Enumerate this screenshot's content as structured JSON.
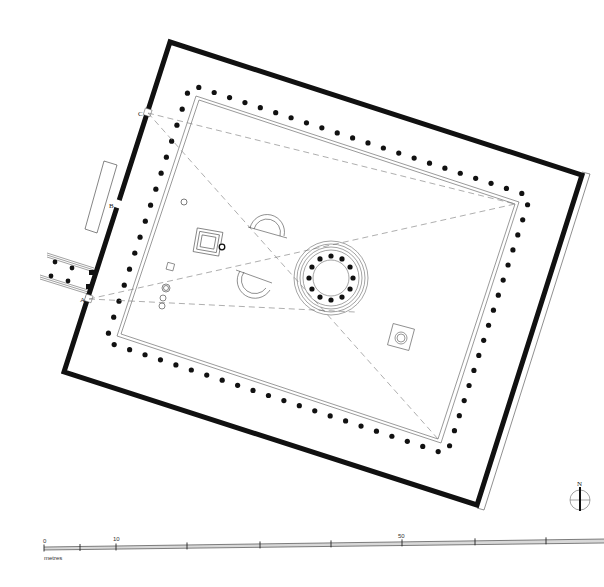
{
  "plan": {
    "title": "Site plan of a colonnaded sanctuary with central tholos",
    "outer_wall": {
      "corners": [
        [
          170,
          42
        ],
        [
          582,
          175
        ],
        [
          477,
          505
        ],
        [
          64,
          372
        ]
      ],
      "color": "#111111"
    },
    "colonnade_stylobate": {
      "corners": [
        [
          196,
          96
        ],
        [
          519,
          202
        ],
        [
          441,
          443
        ],
        [
          117,
          336
        ]
      ]
    },
    "survey_points": [
      {
        "label": "A",
        "x": 89,
        "y": 299
      },
      {
        "label": "B",
        "x": 118,
        "y": 205
      },
      {
        "label": "C",
        "x": 148,
        "y": 113
      }
    ],
    "sight_lines_color": "#777777",
    "tholos": {
      "cx": 331,
      "cy": 278,
      "column_count": 12
    },
    "north_arrow": {
      "label": "N",
      "cx": 580,
      "cy": 500
    }
  },
  "scale_bar": {
    "unit": "metres",
    "labels": [
      {
        "text": "0",
        "x": 44
      },
      {
        "text": "10",
        "x": 116
      },
      {
        "text": "50",
        "x": 402
      }
    ],
    "ticks": [
      44,
      80,
      116,
      187,
      260,
      331,
      402,
      475,
      546
    ]
  }
}
